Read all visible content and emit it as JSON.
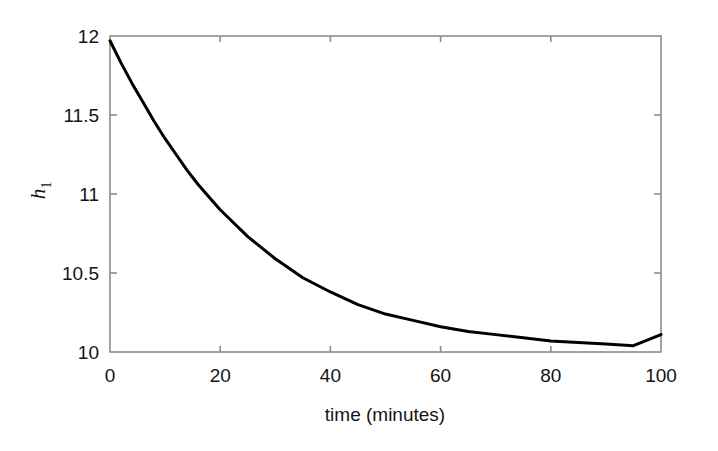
{
  "figure": {
    "background_color": "#ffffff",
    "axis_color": "#808080",
    "curve_color": "#000000",
    "text_color": "#141414"
  },
  "chart_data": {
    "type": "line",
    "title": "",
    "subtitle": "",
    "xlabel": "time (minutes)",
    "ylabel": "h_1",
    "ylabel_base": "h",
    "ylabel_subscript": "1",
    "xlim": [
      0,
      100
    ],
    "ylim": [
      10,
      12
    ],
    "xticks": [
      0,
      20,
      40,
      60,
      80,
      100
    ],
    "xtick_labels": [
      "0",
      "20",
      "40",
      "60",
      "80",
      "100"
    ],
    "yticks": [
      10,
      10.5,
      11,
      11.5,
      12
    ],
    "ytick_labels": [
      "10",
      "10.5",
      "11",
      "11.5",
      "12"
    ],
    "grid": false,
    "legend": null,
    "legend_position": "none",
    "series": [
      {
        "name": "h1",
        "line_width": 3,
        "color": "#000000",
        "x": [
          0,
          2,
          4,
          6,
          8,
          10,
          12,
          14,
          16,
          18,
          20,
          25,
          30,
          35,
          40,
          45,
          50,
          55,
          60,
          65,
          70,
          75,
          80,
          85,
          90,
          95,
          100
        ],
        "values": [
          11.97,
          11.83,
          11.7,
          11.58,
          11.46,
          11.35,
          11.25,
          11.15,
          11.06,
          10.98,
          10.9,
          10.73,
          10.59,
          10.47,
          10.38,
          10.3,
          10.24,
          10.2,
          10.16,
          10.13,
          10.11,
          10.09,
          10.07,
          10.06,
          10.05,
          10.04,
          10.11
        ]
      }
    ],
    "annotations": []
  }
}
